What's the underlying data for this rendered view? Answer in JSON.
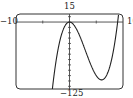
{
  "chart_data": {
    "type": "line",
    "title": "",
    "xlabel": "",
    "ylabel": "",
    "window": {
      "xmin": -10,
      "xmax": 10,
      "ymin": -125,
      "ymax": 15
    },
    "xlim": [
      -10,
      10
    ],
    "ylim": [
      -125,
      15
    ],
    "tick_labels": {
      "xmin": "−10",
      "xmax": "10",
      "ymin": "−125",
      "ymax": "15"
    },
    "x_ticks": [
      -5,
      5
    ],
    "y_ticks": [
      -10,
      -20,
      -30,
      -40,
      -50,
      -60,
      -70,
      -80,
      -90,
      -100,
      -110,
      -120,
      10
    ],
    "grid": false,
    "series": [
      {
        "name": "f(x) = x^3 - 9x^2",
        "function": "x^3 - 9x^2",
        "points": [
          {
            "x": -3.2,
            "y": -124.9
          },
          {
            "x": -3,
            "y": -108
          },
          {
            "x": -2,
            "y": -44
          },
          {
            "x": -1,
            "y": -10
          },
          {
            "x": 0,
            "y": 0
          },
          {
            "x": 1,
            "y": -8
          },
          {
            "x": 2,
            "y": -28
          },
          {
            "x": 3,
            "y": -54
          },
          {
            "x": 4,
            "y": -80
          },
          {
            "x": 5,
            "y": -100
          },
          {
            "x": 6,
            "y": -108
          },
          {
            "x": 7,
            "y": -98
          },
          {
            "x": 8,
            "y": -64
          },
          {
            "x": 9,
            "y": 0
          },
          {
            "x": 9.18,
            "y": 15
          }
        ],
        "color": "#222222"
      }
    ],
    "features": {
      "local_max": {
        "x": 0,
        "y": 0
      },
      "local_min": {
        "x": 6,
        "y": -108
      }
    }
  },
  "style": {
    "frame_color": "#333333",
    "axis_color": "#444444",
    "curve_color": "#222222",
    "background": "#ffffff"
  }
}
